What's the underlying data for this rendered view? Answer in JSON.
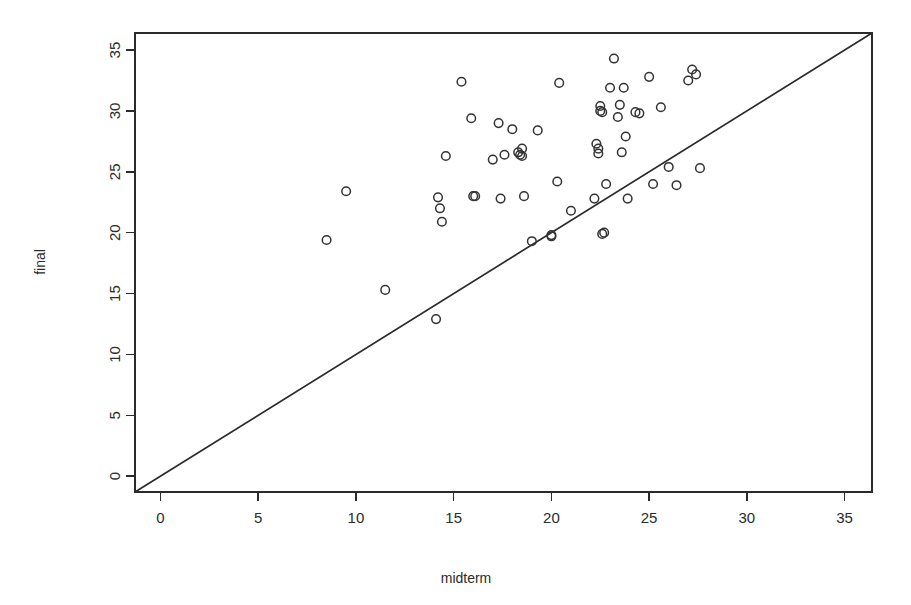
{
  "chart_data": {
    "type": "scatter",
    "title": "",
    "xlabel": "midterm",
    "ylabel": "final",
    "xlim": [
      -1.3,
      36.4
    ],
    "ylim": [
      -1.3,
      36.4
    ],
    "grid": false,
    "legend": null,
    "xticks": [
      0,
      5,
      10,
      15,
      20,
      25,
      30,
      35
    ],
    "yticks": [
      0,
      5,
      10,
      15,
      20,
      25,
      30,
      35
    ],
    "xtick_labels": [
      "0",
      "5",
      "10",
      "15",
      "20",
      "25",
      "30",
      "35"
    ],
    "ytick_labels": [
      "0",
      "5",
      "10",
      "15",
      "20",
      "25",
      "30",
      "35"
    ],
    "marker": "open-circle",
    "marker_color": "#333333",
    "reference_line": {
      "kind": "identity",
      "label": "y = x",
      "slope": 1,
      "intercept": 0,
      "color": "#2b2b2b"
    },
    "x": [
      8.5,
      9.5,
      11.5,
      14.1,
      14.2,
      14.3,
      14.4,
      14.6,
      15.4,
      15.9,
      16.0,
      16.1,
      17.0,
      17.3,
      17.4,
      17.6,
      18.0,
      18.3,
      18.4,
      18.5,
      18.5,
      18.6,
      19.0,
      19.3,
      20.0,
      20.0,
      20.3,
      20.4,
      21.0,
      22.2,
      22.3,
      22.4,
      22.4,
      22.5,
      22.5,
      22.6,
      22.6,
      22.7,
      22.8,
      23.0,
      23.2,
      23.4,
      23.5,
      23.6,
      23.7,
      23.8,
      23.9,
      24.3,
      24.5,
      25.0,
      25.2,
      25.6,
      26.0,
      26.4,
      27.0,
      27.2,
      27.4,
      27.6
    ],
    "y": [
      19.4,
      23.4,
      15.3,
      12.9,
      22.9,
      22.0,
      20.9,
      26.3,
      32.4,
      29.4,
      23.0,
      23.0,
      26.0,
      29.0,
      22.8,
      26.4,
      28.5,
      26.6,
      26.4,
      26.9,
      26.3,
      23.0,
      19.3,
      28.4,
      19.8,
      19.7,
      24.2,
      32.3,
      21.8,
      22.8,
      27.3,
      26.9,
      26.5,
      30.4,
      30.0,
      29.9,
      19.9,
      20.0,
      24.0,
      31.9,
      34.3,
      29.5,
      30.5,
      26.6,
      31.9,
      27.9,
      22.8,
      29.9,
      29.8,
      32.8,
      24.0,
      30.3,
      25.4,
      23.9,
      32.5,
      33.4,
      33.0,
      25.3
    ]
  },
  "axes": {
    "x_axis_title": "midterm",
    "y_axis_title": "final"
  }
}
